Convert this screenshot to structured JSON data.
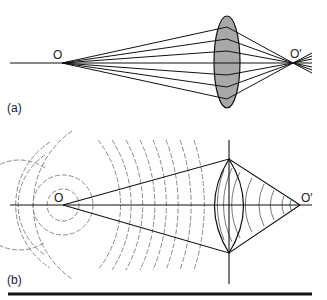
{
  "figure": {
    "panel_a": {
      "label": "(a)",
      "object_label": "O",
      "image_label": "O′",
      "description": "Rays from point object O refracted by a convex lens converge to image point O′",
      "lens_fill": "#a8a8a8"
    },
    "panel_b": {
      "label": "(b)",
      "object_label": "O",
      "image_label": "O′",
      "description": "Spherical wavefronts from O (dashed) pass through lens and converge to O′"
    },
    "colors": {
      "line": "#111111",
      "wavefront": "#8a8a8a",
      "lens_fill": "#a8a8a8"
    }
  }
}
